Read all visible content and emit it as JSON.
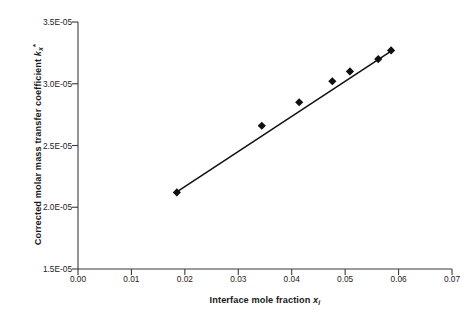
{
  "chart_data": {
    "type": "scatter",
    "title": "",
    "xlabel": "Interface mole fraction x i",
    "ylabel": "Corrected molar mass transfer coefficient k x *",
    "xlabel_parts": {
      "text": "Interface mole fraction ",
      "symbol": "x",
      "subscript": "i"
    },
    "ylabel_parts": {
      "text": "Corrected molar mass transfer coefficient ",
      "symbol": "k",
      "subscript": "x",
      "superscript": "*"
    },
    "xlim": [
      0.0,
      0.07
    ],
    "ylim": [
      1.5e-05,
      3.5e-05
    ],
    "xticks": [
      0.0,
      0.01,
      0.02,
      0.03,
      0.04,
      0.05,
      0.06,
      0.07
    ],
    "xticklabels": [
      "0.00",
      "0.01",
      "0.02",
      "0.03",
      "0.04",
      "0.05",
      "0.06",
      "0.07"
    ],
    "yticks": [
      1.5e-05,
      2e-05,
      2.5e-05,
      3e-05,
      3.5e-05
    ],
    "yticklabels": [
      "1.5E-05",
      "2.0E-05",
      "2.5E-05",
      "3.0E-05",
      "3.5E-05"
    ],
    "grid": false,
    "legend": false,
    "marker": "filled-diamond",
    "marker_color": "#101010",
    "line_color": "#101010",
    "series": [
      {
        "name": "Corrected molar mass transfer coefficient",
        "x": [
          0.0185,
          0.0344,
          0.0414,
          0.0476,
          0.0509,
          0.0562,
          0.0586
        ],
        "y": [
          2.12e-05,
          2.66e-05,
          2.85e-05,
          3.02e-05,
          3.1e-05,
          3.2e-05,
          3.27e-05
        ]
      }
    ],
    "fit_line": {
      "x": [
        0.0185,
        0.0586
      ],
      "y": [
        2.125e-05,
        3.265e-05
      ]
    }
  },
  "colors": {
    "axis": "#3a3a3a",
    "text": "#1a1a1a",
    "data": "#101010",
    "background": "#ffffff"
  }
}
